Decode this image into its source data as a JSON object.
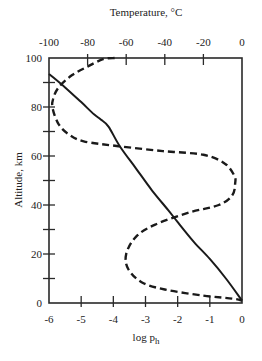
{
  "chart_data": {
    "type": "line",
    "title": "",
    "top_axis": {
      "label": "Temperature, °C",
      "range": [
        -100,
        0
      ],
      "ticks": [
        -100,
        -80,
        -60,
        -40,
        -20,
        0
      ],
      "tick_labels": [
        "-100",
        "-80",
        "-60",
        "-40",
        "-20",
        "0"
      ]
    },
    "bottom_axis": {
      "label": "log p",
      "label_subscript": "h",
      "range": [
        -6,
        0
      ],
      "ticks": [
        -6,
        -5,
        -4,
        -3,
        -2,
        -1,
        0
      ],
      "tick_labels": [
        "-6",
        "-5",
        "-4",
        "-3",
        "-2",
        "-1",
        "0"
      ]
    },
    "left_axis": {
      "label": "Altitude, km",
      "range": [
        0,
        100
      ],
      "major_ticks": [
        0,
        20,
        40,
        60,
        80,
        100
      ],
      "tick_labels": [
        "0",
        "20",
        "40",
        "60",
        "80",
        "100"
      ],
      "minor_ticks": [
        10,
        30,
        50,
        70,
        90
      ]
    },
    "grid": false,
    "legend": null,
    "series": [
      {
        "name": "log p_h (pressure)",
        "style": "solid",
        "axis_x": "bottom",
        "points": [
          {
            "x": -6.0,
            "alt": 93.5
          },
          {
            "x": -5.5,
            "alt": 88
          },
          {
            "x": -5.0,
            "alt": 82
          },
          {
            "x": -4.6,
            "alt": 77
          },
          {
            "x": -4.4,
            "alt": 75
          },
          {
            "x": -4.15,
            "alt": 72
          },
          {
            "x": -3.8,
            "alt": 64
          },
          {
            "x": -3.3,
            "alt": 55
          },
          {
            "x": -2.8,
            "alt": 46
          },
          {
            "x": -2.3,
            "alt": 38
          },
          {
            "x": -2.0,
            "alt": 33
          },
          {
            "x": -1.5,
            "alt": 25
          },
          {
            "x": -1.0,
            "alt": 18
          },
          {
            "x": -0.5,
            "alt": 10
          },
          {
            "x": 0.0,
            "alt": 1
          }
        ]
      },
      {
        "name": "Temperature",
        "style": "dashed",
        "axis_x": "top",
        "points": [
          {
            "x": -66,
            "alt": 100
          },
          {
            "x": -72,
            "alt": 99.5
          },
          {
            "x": -80,
            "alt": 96.5
          },
          {
            "x": -88,
            "alt": 93
          },
          {
            "x": -95,
            "alt": 88
          },
          {
            "x": -98,
            "alt": 83
          },
          {
            "x": -98,
            "alt": 79
          },
          {
            "x": -95,
            "alt": 73
          },
          {
            "x": -90,
            "alt": 69
          },
          {
            "x": -82,
            "alt": 66
          },
          {
            "x": -64,
            "alt": 64
          },
          {
            "x": -41,
            "alt": 62
          },
          {
            "x": -20,
            "alt": 60.5
          },
          {
            "x": -9,
            "alt": 57
          },
          {
            "x": -4,
            "alt": 52
          },
          {
            "x": -3.5,
            "alt": 49
          },
          {
            "x": -5,
            "alt": 44
          },
          {
            "x": -12,
            "alt": 40
          },
          {
            "x": -27,
            "alt": 37
          },
          {
            "x": -45,
            "alt": 32
          },
          {
            "x": -55,
            "alt": 27
          },
          {
            "x": -60,
            "alt": 20
          },
          {
            "x": -59,
            "alt": 14
          },
          {
            "x": -52,
            "alt": 8.5
          },
          {
            "x": -40,
            "alt": 5.5
          },
          {
            "x": -20,
            "alt": 3
          },
          {
            "x": -5,
            "alt": 1.8
          },
          {
            "x": 0,
            "alt": 1
          }
        ]
      }
    ]
  }
}
